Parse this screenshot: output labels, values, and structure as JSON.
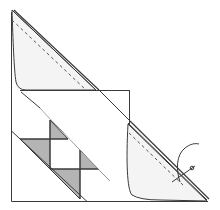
{
  "diagram": {
    "type": "quilting-instruction",
    "colors": {
      "background": "#ffffff",
      "line": "#3a3a3a",
      "fabric_light": "#f4f4f4",
      "fabric_shaded": "#b4b4b4",
      "stitch": "#555555"
    },
    "elements": [
      {
        "name": "block-square",
        "label": ""
      },
      {
        "name": "upper-folded-triangle",
        "label": ""
      },
      {
        "name": "folded-rectangle-flap",
        "label": ""
      },
      {
        "name": "lower-right-folded-triangle",
        "label": ""
      },
      {
        "name": "shaded-triangles",
        "count": 4
      },
      {
        "name": "stitch-line-upper",
        "style": "dashed"
      },
      {
        "name": "stitch-line-lower",
        "style": "dashed"
      },
      {
        "name": "needle"
      },
      {
        "name": "thread"
      }
    ]
  }
}
